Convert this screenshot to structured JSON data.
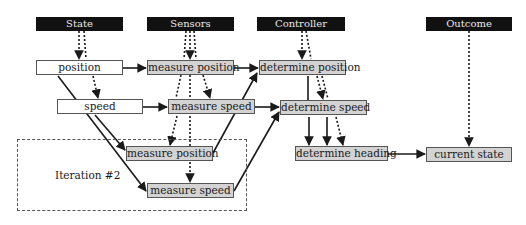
{
  "headers": {
    "state": "State",
    "sensors": "Sensors",
    "controller": "Controller",
    "outcome": "Outcome"
  },
  "nodes": {
    "position": "position",
    "speed": "speed",
    "measure_position": "measure position",
    "measure_speed": "measure speed",
    "determine_position": "determine position",
    "determine_speed": "determine speed",
    "measure_position_iter2": "measure position",
    "measure_speed_iter2": "measure speed",
    "determine_heading": "determine heading",
    "current_state": "current state"
  },
  "iteration": {
    "label": "Iteration #2"
  },
  "colors": {
    "header_bg": "#111111",
    "header_text": "#e8e8e8",
    "process_fill": "#d3d3d3",
    "state_fill": "#ffffff",
    "line": "#1a1a1a"
  }
}
